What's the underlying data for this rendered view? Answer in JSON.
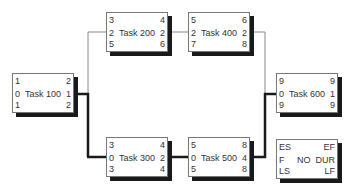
{
  "diagram": {
    "type": "network-diagram-critical-path",
    "nodes": [
      {
        "id": "t100",
        "name": "Task 100",
        "es": "1",
        "ef": "2",
        "f": "0",
        "dur": "1",
        "ls": "1",
        "lf": "2",
        "critical": true
      },
      {
        "id": "t200",
        "name": "Task 200",
        "es": "3",
        "ef": "4",
        "f": "2",
        "dur": "2",
        "ls": "5",
        "lf": "6",
        "critical": false
      },
      {
        "id": "t300",
        "name": "Task 300",
        "es": "3",
        "ef": "4",
        "f": "0",
        "dur": "2",
        "ls": "3",
        "lf": "4",
        "critical": true
      },
      {
        "id": "t400",
        "name": "Task 400",
        "es": "5",
        "ef": "6",
        "f": "2",
        "dur": "2",
        "ls": "7",
        "lf": "8",
        "critical": false
      },
      {
        "id": "t500",
        "name": "Task 500",
        "es": "5",
        "ef": "8",
        "f": "0",
        "dur": "4",
        "ls": "5",
        "lf": "8",
        "critical": true
      },
      {
        "id": "t600",
        "name": "Task 600",
        "es": "9",
        "ef": "9",
        "f": "0",
        "dur": "1",
        "ls": "9",
        "lf": "9",
        "critical": true
      }
    ],
    "edges": [
      {
        "from": "Task 100",
        "to": "Task 200",
        "critical": false
      },
      {
        "from": "Task 100",
        "to": "Task 300",
        "critical": true
      },
      {
        "from": "Task 200",
        "to": "Task 400",
        "critical": false
      },
      {
        "from": "Task 300",
        "to": "Task 500",
        "critical": true
      },
      {
        "from": "Task 400",
        "to": "Task 600",
        "critical": false
      },
      {
        "from": "Task 500",
        "to": "Task 600",
        "critical": true
      }
    ],
    "legend": {
      "es": "ES",
      "ef": "EF",
      "f": "F",
      "no": "NO",
      "dur": "DUR",
      "ls": "LS",
      "lf": "LF"
    },
    "colors": {
      "critical_line": "#1a1a1a",
      "normal_line": "#888888",
      "shadow": "#1a1a1a",
      "border": "#777777"
    }
  }
}
